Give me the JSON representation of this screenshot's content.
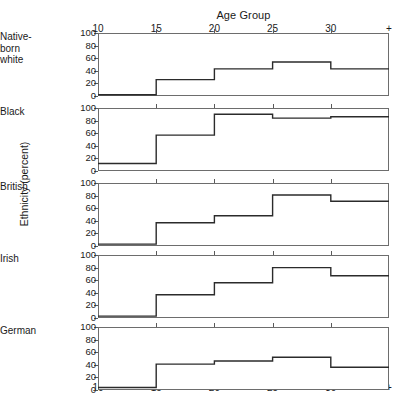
{
  "chart_data": {
    "type": "line",
    "subtype": "step-small-multiples",
    "title": "Age Group",
    "xlabel": "Age Group",
    "ylabel": "Ethnicity (percent)",
    "x_tick_labels": [
      "10",
      "15",
      "20",
      "25",
      "30",
      "+"
    ],
    "x_tick_values": [
      10,
      15,
      20,
      25,
      30,
      35
    ],
    "xlim": [
      10,
      35
    ],
    "ylim": [
      0,
      100
    ],
    "y_tick_labels": [
      "0",
      "20",
      "40",
      "60",
      "80",
      "100"
    ],
    "y_tick_values": [
      0,
      20,
      40,
      60,
      80,
      100
    ],
    "grid": false,
    "legend": "none",
    "axis_top": true,
    "axis_bottom": true,
    "bin_edges": [
      10,
      15,
      20,
      25,
      30,
      35
    ],
    "bin_labels": [
      "10-14",
      "15-19",
      "20-24",
      "25-29",
      "30+"
    ],
    "series": [
      {
        "name": "Native-born white",
        "values": [
          2,
          26,
          43,
          54,
          43
        ]
      },
      {
        "name": "Black",
        "values": [
          12,
          57,
          90,
          84,
          86
        ]
      },
      {
        "name": "British",
        "values": [
          3,
          37,
          48,
          81,
          71
        ]
      },
      {
        "name": "Irish",
        "values": [
          3,
          37,
          56,
          80,
          67
        ]
      },
      {
        "name": "German",
        "values": [
          4,
          41,
          46,
          52,
          36
        ]
      }
    ]
  },
  "panels": [
    {
      "label_line1": "Native-",
      "label_line2": "born",
      "label_line3": "white"
    },
    {
      "label_line1": "Black",
      "label_line2": "",
      "label_line3": ""
    },
    {
      "label_line1": "British",
      "label_line2": "",
      "label_line3": ""
    },
    {
      "label_line1": "Irish",
      "label_line2": "",
      "label_line3": ""
    },
    {
      "label_line1": "German",
      "label_line2": "",
      "label_line3": ""
    }
  ],
  "style": {
    "line_color": "#2b2b2b",
    "frame_color": "#6d6d6d",
    "text_color": "#1a1a1a",
    "background": "#ffffff"
  }
}
